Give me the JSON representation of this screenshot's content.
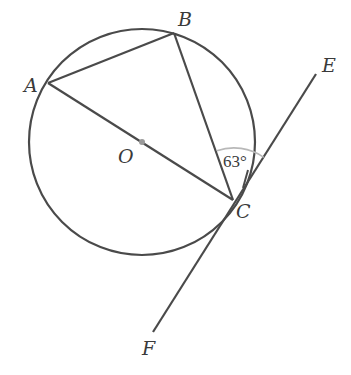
{
  "diagram": {
    "type": "circle-geometry",
    "colors": {
      "stroke": "#4a4a4a",
      "angle_arc": "#b8b8b8",
      "center_dot": "#9a9a9a",
      "background": "#ffffff"
    },
    "circle": {
      "center_label": "O",
      "cx": 142,
      "cy": 142,
      "r": 113
    },
    "points": {
      "A": {
        "label": "A",
        "x": 48,
        "y": 83
      },
      "B": {
        "label": "B",
        "x": 174,
        "y": 33
      },
      "C": {
        "label": "C",
        "x": 233,
        "y": 200
      },
      "O": {
        "label": "O",
        "x": 142,
        "y": 142
      },
      "E": {
        "label": "E",
        "x": 316,
        "y": 74
      },
      "F": {
        "label": "F",
        "x": 153,
        "y": 332
      }
    },
    "segments": [
      {
        "from": "A",
        "to": "B"
      },
      {
        "from": "B",
        "to": "C"
      },
      {
        "from": "A",
        "to": "C",
        "note": "diameter through O"
      },
      {
        "from": "E",
        "to": "F",
        "note": "tangent at C"
      }
    ],
    "angle_marker": {
      "vertex": "C",
      "between": [
        "CB",
        "CE"
      ],
      "label": "63°"
    }
  }
}
